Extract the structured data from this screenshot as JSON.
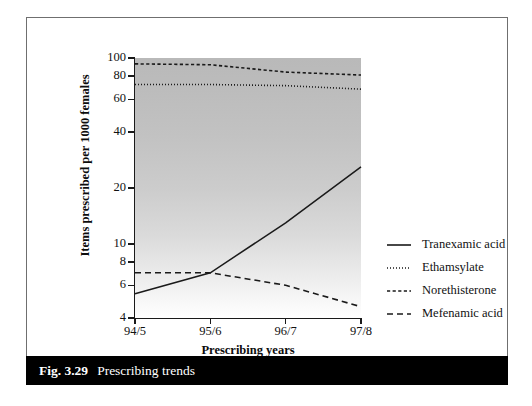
{
  "caption": {
    "number": "Fig. 3.29",
    "text": "Prescribing trends"
  },
  "chart_data": {
    "type": "line",
    "title": "",
    "xlabel": "Prescribing years",
    "ylabel": "Items prescribed per 1000 females",
    "x": [
      "94/5",
      "95/6",
      "96/7",
      "97/8"
    ],
    "categories": [
      "94/5",
      "95/6",
      "96/7",
      "97/8"
    ],
    "yscale": "log",
    "ylim": [
      4,
      100
    ],
    "yticks": [
      4,
      6,
      8,
      10,
      20,
      40,
      60,
      80,
      100
    ],
    "ytick_labels": [
      "4",
      "6",
      "8",
      "10",
      "20",
      "40",
      "60",
      "80",
      "100"
    ],
    "grid": false,
    "legend_position": "right",
    "plot_background": "vertical grey gradient, dark at top fading to white at bottom",
    "series": [
      {
        "name": "Tranexamic acid",
        "style": "solid",
        "color": "#1a1a1a",
        "values": [
          5.4,
          7.0,
          13.0,
          26.0
        ]
      },
      {
        "name": "Ethamsylate",
        "style": "dotted",
        "color": "#1a1a1a",
        "values": [
          72,
          72,
          71,
          68
        ]
      },
      {
        "name": "Norethisterone",
        "style": "short-dash",
        "color": "#1a1a1a",
        "values": [
          93,
          92,
          84,
          81
        ]
      },
      {
        "name": "Mefenamic acid",
        "style": "dash",
        "color": "#1a1a1a",
        "values": [
          7.0,
          7.0,
          6.0,
          4.6
        ]
      }
    ]
  },
  "legend": {
    "items": [
      {
        "label": "Tranexamic acid",
        "style": "solid"
      },
      {
        "label": "Ethamsylate",
        "style": "dotted"
      },
      {
        "label": "Norethisterone",
        "style": "short-dash"
      },
      {
        "label": "Mefenamic acid",
        "style": "dash"
      }
    ]
  },
  "colors": {
    "ink": "#1a1a1a",
    "frame": "#6f6f6f",
    "caption_bar": "#000000",
    "caption_text": "#ffffff"
  }
}
